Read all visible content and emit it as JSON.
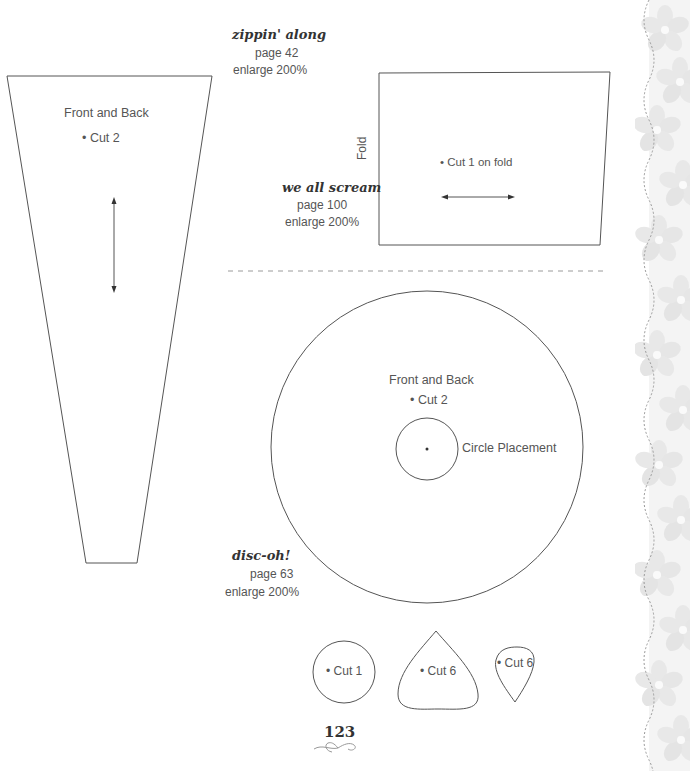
{
  "page": {
    "number": "123",
    "accent_colors": {
      "line": "#555555",
      "dashed_divider": "#9a9a9a",
      "border_petal": "#e6e6e6",
      "border_stitch": "#9a9a9a"
    }
  },
  "projects": [
    {
      "title": "zippin' along",
      "page_ref": "page 42",
      "enlarge": "enlarge 200%",
      "pieces": [
        {
          "name": "Front and Back",
          "cut": "Cut 2",
          "grainline": "vertical"
        }
      ]
    },
    {
      "title": "we all scream",
      "page_ref": "page 100",
      "enlarge": "enlarge 200%",
      "pieces": [
        {
          "name": "",
          "cut": "Cut 1 on fold",
          "fold_label": "Fold",
          "grainline": "horizontal"
        }
      ]
    },
    {
      "title": "disc-oh!",
      "page_ref": "page 63",
      "enlarge": "enlarge 200%",
      "pieces": [
        {
          "name": "Front and Back",
          "cut": "Cut 2",
          "placement_label": "Circle Placement"
        },
        {
          "shape": "circle",
          "cut": "Cut 1"
        },
        {
          "shape": "petal",
          "cut": "Cut 6"
        },
        {
          "shape": "teardrop",
          "cut": "Cut 6"
        }
      ]
    }
  ],
  "bullet": "•"
}
